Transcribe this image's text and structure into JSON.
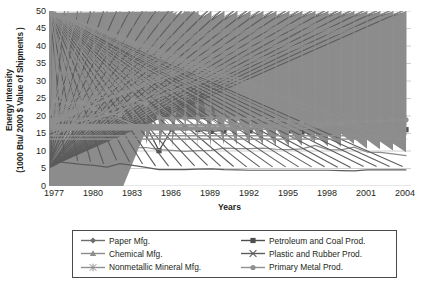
{
  "chart_data": {
    "type": "line",
    "title": "",
    "xlabel": "Years",
    "ylabel": "Energy Intensity (1000 Btu/ 2000 $ Value of Shipments )",
    "ylabel_line1": "Energy Intensity",
    "ylabel_line2": "(1000 Btu/ 2000 $ Value of Shipments )",
    "xlim": [
      1977,
      2004
    ],
    "ylim": [
      0,
      50
    ],
    "ytick_step": 5,
    "xtick_step": 3,
    "grid": "horizontal",
    "legend_position": "bottom",
    "yticks": [
      "0",
      "5",
      "10",
      "15",
      "20",
      "25",
      "30",
      "35",
      "40",
      "45",
      "50"
    ],
    "xticks": [
      "1977",
      "1980",
      "1983",
      "1986",
      "1989",
      "1992",
      "1995",
      "1998",
      "2001",
      "2004"
    ],
    "x": [
      1977,
      1978,
      1979,
      1980,
      1981,
      1982,
      1983,
      1984,
      1985,
      1986,
      1987,
      1988,
      1989,
      1990,
      1991,
      1992,
      1993,
      1994,
      1995,
      1996,
      1997,
      1998,
      1999,
      2000,
      2001,
      2002,
      2003,
      2004
    ],
    "series": [
      {
        "name": "Paper Mfg.",
        "marker": "diamond",
        "color": "#6e6e6e",
        "values": [
          19.8,
          19.5,
          18.8,
          19.4,
          19.2,
          19.4,
          18.0,
          17.4,
          19.6,
          19.3,
          19.4,
          19.5,
          19.7,
          20.5,
          19.5,
          20.4,
          20.5,
          19.6,
          19.1,
          19.9,
          19.9,
          20.0,
          19.9,
          19.4,
          19.3,
          19.9,
          20.0,
          20.0
        ]
      },
      {
        "name": "Petroleum and Coal Prod.",
        "marker": "square",
        "color": "#4f4f4f",
        "values": [
          40.5,
          47.7,
          36.3,
          44.7,
          23.4,
          27.7,
          17.6,
          17.3,
          10.1,
          16.3,
          16.6,
          16.1,
          15.6,
          15.9,
          16.6,
          15.8,
          18.6,
          16.7,
          15.8,
          15.4,
          16.4,
          17.1,
          17.7,
          17.9,
          14.2,
          14.1,
          15.8,
          16.1
        ]
      },
      {
        "name": "Chemical Mfg.",
        "marker": "triangle",
        "color": "#8c8c8c",
        "values": [
          15.4,
          14.6,
          14.7,
          14.9,
          13.6,
          12.2,
          10.9,
          11.0,
          10.4,
          10.2,
          9.9,
          10.1,
          10.2,
          10.8,
          10.7,
          10.7,
          10.8,
          10.5,
          10.4,
          10.6,
          11.6,
          10.4,
          10.3,
          11.1,
          9.7,
          9.6,
          9.2,
          8.7
        ]
      },
      {
        "name": "Plastic and Rubber Prod.",
        "marker": "x",
        "color": "#5c5c5c",
        "values": [
          7.0,
          6.6,
          6.2,
          5.9,
          5.4,
          6.4,
          5.9,
          5.3,
          4.7,
          4.7,
          4.7,
          4.8,
          4.9,
          4.7,
          4.6,
          4.5,
          4.5,
          4.5,
          4.5,
          4.5,
          4.5,
          4.5,
          4.4,
          4.3,
          4.6,
          4.6,
          4.6,
          4.6
        ]
      },
      {
        "name": "Nonmetallic Mineral Mfg.",
        "marker": "star",
        "color": "#8f8f8f",
        "values": [
          19.3,
          19.0,
          18.6,
          19.4,
          20.3,
          19.1,
          17.6,
          17.2,
          17.1,
          16.9,
          16.7,
          16.3,
          16.0,
          16.2,
          16.2,
          16.5,
          17.4,
          16.7,
          16.1,
          16.3,
          16.6,
          17.1,
          17.2,
          17.6,
          14.4,
          14.3,
          13.4,
          13.4
        ]
      },
      {
        "name": "Primary Metal Prod.",
        "marker": "circle",
        "color": "#909090",
        "values": [
          24.4,
          23.6,
          23.8,
          22.1,
          20.5,
          20.3,
          24.7,
          23.4,
          19.6,
          19.4,
          19.4,
          19.5,
          19.6,
          19.4,
          19.3,
          19.4,
          19.2,
          18.8,
          18.4,
          18.1,
          18.0,
          18.1,
          18.0,
          18.3,
          18.4,
          18.6,
          18.9,
          18.9
        ]
      }
    ]
  },
  "legend": {
    "items": [
      {
        "label": "Paper Mfg."
      },
      {
        "label": "Petroleum and Coal Prod."
      },
      {
        "label": "Chemical Mfg."
      },
      {
        "label": "Plastic and Rubber Prod."
      },
      {
        "label": "Nonmetallic Mineral Mfg."
      },
      {
        "label": "Primary Metal Prod."
      }
    ]
  }
}
